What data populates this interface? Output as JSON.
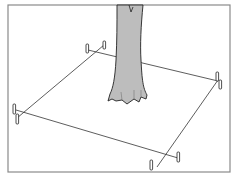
{
  "diagram": {
    "colors": {
      "frame": "#8a8a8a",
      "trunk_fill": "#bdbdbd",
      "outline": "#222222",
      "string": "#333333",
      "background": "#ffffff"
    },
    "elements": {
      "frame": "border-frame",
      "trunk": "tree-trunk",
      "strings": [
        "string-back",
        "string-right",
        "string-front",
        "string-left"
      ],
      "stakes": [
        "stake-back-left",
        "stake-back-right",
        "stake-right-top",
        "stake-right-bottom",
        "stake-left-top",
        "stake-left-bottom",
        "stake-front-left",
        "stake-front-right"
      ]
    }
  }
}
